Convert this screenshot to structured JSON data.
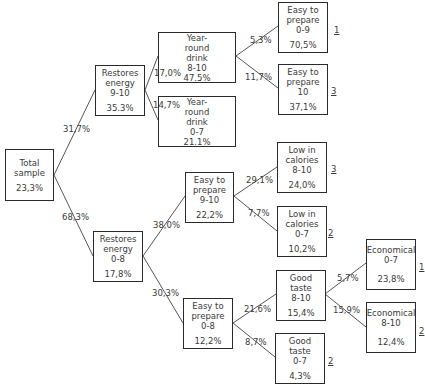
{
  "nodes": {
    "root": {
      "label": "Total\nsample",
      "value": "23,3%"
    },
    "re910": {
      "label": "Restores\nenergy\n9-10",
      "value": "35.3%"
    },
    "re08": {
      "label": "Restores\nenergy\n0-8",
      "value": "17,8%"
    },
    "yr810": {
      "label": "Year-\nround\ndrink\n8-10",
      "value": "47.5%"
    },
    "yr07": {
      "label": "Year-\nround\ndrink\n0-7",
      "value": "21.1%"
    },
    "ep09": {
      "label": "Easy to\nprepare\n0-9",
      "value": "70,5%",
      "rank": "1"
    },
    "ep10": {
      "label": "Easy to\nprepare\n10",
      "value": "37,1%",
      "rank": "3"
    },
    "lc810": {
      "label": "Low in\ncalories\n8-10",
      "value": "24,0%",
      "rank": "3"
    },
    "lc07": {
      "label": "Low in\ncalories\n0-7",
      "value": "10,2%",
      "rank": "2"
    },
    "ep910": {
      "label": "Easy to\nprepare\n9-10",
      "value": "22,2%"
    },
    "ep08": {
      "label": "Easy to\nprepare\n0-8",
      "value": "12,2%"
    },
    "gt810": {
      "label": "Good\ntaste\n8-10",
      "value": "15,4%"
    },
    "gt07": {
      "label": "Good\ntaste\n0-7",
      "value": "4,3%",
      "rank": "2"
    },
    "ec07": {
      "label": "Economical\n0-7",
      "value": "23,8%",
      "rank": "1"
    },
    "ec810": {
      "label": "Economical\n8-10",
      "value": "12,4%",
      "rank": "2"
    }
  },
  "edges": {
    "root_re910": "31,7%",
    "root_re08": "68,3%",
    "re910_yr810": "17,0%",
    "re910_yr07": "14,7%",
    "yr810_ep09": "5,3%",
    "yr810_ep10": "11,7%",
    "re08_ep910": "38,0%",
    "re08_ep08": "30,3%",
    "ep910_lc810": "29,1%",
    "ep910_lc07": "7,7%",
    "ep08_gt810": "21,6%",
    "ep08_gt07": "8,7%",
    "gt810_ec07": "5,7%",
    "gt810_ec810": "15,9%"
  },
  "colors": {
    "line": "#555555",
    "border": "#2a2a2a",
    "text": "#3a3a3a"
  }
}
